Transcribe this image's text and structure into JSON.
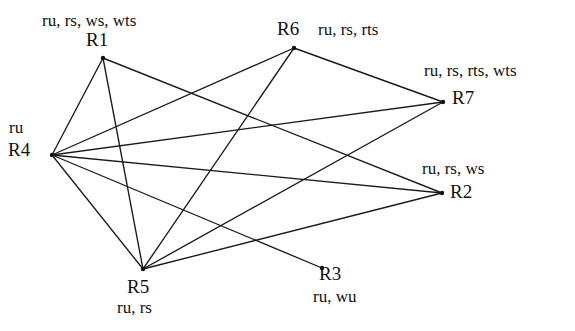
{
  "diagram": {
    "background_color": "#ffffff",
    "edge_color": "#1a1a1a",
    "text_color": "#101010",
    "nodes": [
      {
        "id": "R1",
        "label": "R1",
        "attributes": "ru, rs, ws, wts",
        "x": 103,
        "y": 58
      },
      {
        "id": "R2",
        "label": "R2",
        "attributes": "ru, rs, ws",
        "x": 442,
        "y": 193
      },
      {
        "id": "R3",
        "label": "R3",
        "attributes": "ru, wu",
        "x": 322,
        "y": 268
      },
      {
        "id": "R4",
        "label": "R4",
        "attributes": "ru",
        "x": 52,
        "y": 155
      },
      {
        "id": "R5",
        "label": "R5",
        "attributes": "ru, rs",
        "x": 143,
        "y": 269
      },
      {
        "id": "R6",
        "label": "R6",
        "attributes": "ru, rs, rts",
        "x": 294,
        "y": 48
      },
      {
        "id": "R7",
        "label": "R7",
        "attributes": "ru, rs, rts, wts",
        "x": 443,
        "y": 102
      }
    ],
    "edges": [
      {
        "from": "R4",
        "to": "R1"
      },
      {
        "from": "R4",
        "to": "R5"
      },
      {
        "from": "R4",
        "to": "R6"
      },
      {
        "from": "R4",
        "to": "R7"
      },
      {
        "from": "R4",
        "to": "R2"
      },
      {
        "from": "R4",
        "to": "R3"
      },
      {
        "from": "R1",
        "to": "R5"
      },
      {
        "from": "R1",
        "to": "R2"
      },
      {
        "from": "R5",
        "to": "R6"
      },
      {
        "from": "R5",
        "to": "R7"
      },
      {
        "from": "R5",
        "to": "R2"
      },
      {
        "from": "R6",
        "to": "R7"
      }
    ],
    "labels": [
      {
        "key": "r1_attrs",
        "text": "ru, rs, ws, wts",
        "x": 42,
        "y": 12,
        "kind": "attrs"
      },
      {
        "key": "r1_id",
        "text": "R1",
        "x": 86,
        "y": 30,
        "kind": "id"
      },
      {
        "key": "r6_id",
        "text": "R6",
        "x": 277,
        "y": 19,
        "kind": "id"
      },
      {
        "key": "r6_attrs",
        "text": "ru, rs, rts",
        "x": 318,
        "y": 21,
        "kind": "attrs"
      },
      {
        "key": "r7_attrs",
        "text": "ru, rs, rts, wts",
        "x": 424,
        "y": 62,
        "kind": "attrs"
      },
      {
        "key": "r7_id",
        "text": "R7",
        "x": 452,
        "y": 88,
        "kind": "id"
      },
      {
        "key": "r4_attrs",
        "text": "ru",
        "x": 9,
        "y": 119,
        "kind": "attrs"
      },
      {
        "key": "r4_id",
        "text": "R4",
        "x": 8,
        "y": 140,
        "kind": "id"
      },
      {
        "key": "r2_attrs",
        "text": "ru, rs, ws",
        "x": 422,
        "y": 160,
        "kind": "attrs"
      },
      {
        "key": "r2_id",
        "text": "R2",
        "x": 450,
        "y": 182,
        "kind": "id"
      },
      {
        "key": "r5_id",
        "text": "R5",
        "x": 127,
        "y": 277,
        "kind": "id"
      },
      {
        "key": "r5_attrs",
        "text": "ru, rs",
        "x": 117,
        "y": 299,
        "kind": "attrs"
      },
      {
        "key": "r3_id",
        "text": "R3",
        "x": 319,
        "y": 264,
        "kind": "id"
      },
      {
        "key": "r3_attrs",
        "text": "ru, wu",
        "x": 313,
        "y": 288,
        "kind": "attrs"
      }
    ]
  }
}
